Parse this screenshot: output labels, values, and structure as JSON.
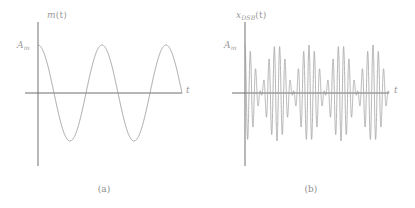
{
  "figure": {
    "background_color": "#ffffff",
    "curve_color": "#9a9a9a",
    "axis_color": "#7d7d7d",
    "text_color": "#8e8e8e"
  },
  "panels": [
    {
      "id": "a",
      "caption": "(a)",
      "y_axis_label": "m",
      "y_axis_label_sub": "",
      "y_axis_label_arg": "(t)",
      "y_tick_label": "A",
      "y_tick_label_sub": "m",
      "x_axis_label": "t",
      "signal": "message"
    },
    {
      "id": "b",
      "caption": "(b)",
      "y_axis_label": "x",
      "y_axis_label_sub": "DSB",
      "y_axis_label_arg": "(t)",
      "y_tick_label": "A",
      "y_tick_label_sub": "m",
      "x_axis_label": "t",
      "signal": "dsb"
    }
  ],
  "chart_data": [
    {
      "type": "line",
      "panel": "a",
      "title": "m (t)",
      "xlabel": "t",
      "ylabel": "m (t)",
      "ytick_labels": [
        "A_m"
      ],
      "ytick_values": [
        1.0
      ],
      "grid": false,
      "legend": null,
      "xlim": [
        0,
        2.3
      ],
      "ylim": [
        -1.15,
        1.15
      ],
      "description": "Sinusoidal message signal m(t) = A_m cos(2 pi f_m t), starting at peak amplitude A_m at t = 0 and completing about 2.25 cycles.",
      "equation": "m(t) = A_m*cos(2*pi*f_m*t)",
      "amplitude": 1.0,
      "cycles": 2.25,
      "axis_geometry": {
        "y_axis_x": 38,
        "y_axis_top": 22,
        "y_axis_bottom": 166,
        "x_axis_y": 93,
        "x_axis_left": 25,
        "x_axis_right": 182,
        "amplitude_px": 48,
        "period_px": 64
      }
    },
    {
      "type": "line",
      "panel": "b",
      "title": "x_DSB (t)",
      "xlabel": "t",
      "ylabel": "x_DSB (t)",
      "ytick_labels": [
        "A_m"
      ],
      "ytick_values": [
        1.0
      ],
      "grid": false,
      "legend": null,
      "xlim": [
        0,
        2.3
      ],
      "ylim": [
        -1.15,
        1.15
      ],
      "description": "Double-sideband suppressed-carrier signal x_DSB(t) = A_m cos(2 pi f_m t) cos(2 pi f_c t); a high frequency carrier whose envelope follows the magnitude of the message, with phase reversals at the envelope nulls.",
      "equation": "x_DSB(t) = A_m*cos(2*pi*f_m*t)*cos(2*pi*f_c*t)",
      "amplitude": 1.0,
      "envelope_cycles": 2.25,
      "carrier_cycles_per_envelope_cycle": 12,
      "axis_geometry": {
        "y_axis_x": 38,
        "y_axis_top": 22,
        "y_axis_bottom": 166,
        "x_axis_y": 93,
        "x_axis_left": 25,
        "x_axis_right": 182,
        "amplitude_px": 48,
        "period_px": 64
      }
    }
  ]
}
